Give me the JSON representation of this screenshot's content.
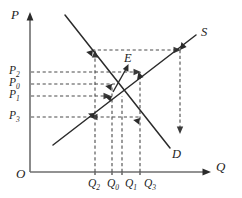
{
  "figure": {
    "type": "cobweb-supply-demand-diagram",
    "axes": {
      "y_label": "P",
      "x_label": "Q",
      "origin_label": "O"
    },
    "curves": [
      {
        "key": "supply",
        "label": "S",
        "slope": "upward"
      },
      {
        "key": "demand",
        "label": "D",
        "slope": "downward"
      }
    ],
    "equilibrium": {
      "label": "E"
    },
    "price_ticks": [
      {
        "id": "p2",
        "label": "P",
        "sub": "2"
      },
      {
        "id": "p0",
        "label": "P",
        "sub": "0"
      },
      {
        "id": "p1",
        "label": "P",
        "sub": "1"
      },
      {
        "id": "p3",
        "label": "P",
        "sub": "3"
      }
    ],
    "quantity_ticks": [
      {
        "id": "q2",
        "label": "Q",
        "sub": "2"
      },
      {
        "id": "q0",
        "label": "Q",
        "sub": "0"
      },
      {
        "id": "q1",
        "label": "Q",
        "sub": "1"
      },
      {
        "id": "q3",
        "label": "Q",
        "sub": "3"
      }
    ],
    "colors": {
      "axis": "#6e6e6e",
      "curve": "#2b2b2b",
      "dashed": "#4a4a4a",
      "text": "#1d1d1d",
      "background": "#ffffff"
    }
  }
}
